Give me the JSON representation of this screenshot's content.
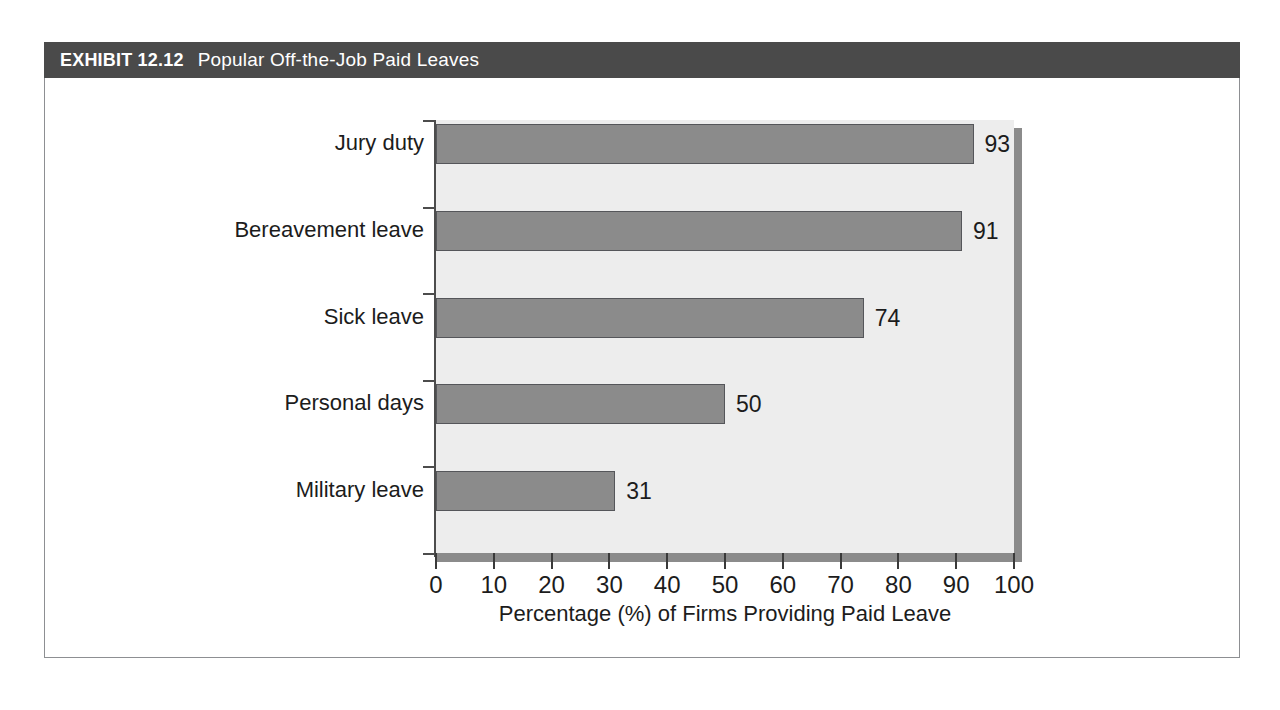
{
  "exhibit": {
    "number_label": "EXHIBIT 12.12",
    "title": "Popular Off-the-Job Paid Leaves",
    "header_bg": "#4a4a4a",
    "header_text_color": "#ffffff",
    "frame_border_color": "#8d8f92"
  },
  "chart_data": {
    "type": "bar",
    "orientation": "horizontal",
    "title": "Popular Off-the-Job Paid Leaves",
    "subtitle": "",
    "categories": [
      "Jury duty",
      "Bereavement leave",
      "Sick leave",
      "Personal days",
      "Military leave"
    ],
    "values": [
      93,
      91,
      74,
      50,
      31
    ],
    "data_labels": [
      "93",
      "91",
      "74",
      "50",
      "31"
    ],
    "xlabel": "Percentage (%) of Firms Providing Paid Leave",
    "ylabel": "",
    "xlim": [
      0,
      100
    ],
    "xticks": [
      0,
      10,
      20,
      30,
      40,
      50,
      60,
      70,
      80,
      90,
      100
    ],
    "xtick_labels": [
      "0",
      "10",
      "20",
      "30",
      "40",
      "50",
      "60",
      "70",
      "80",
      "90",
      "100"
    ],
    "grid": false,
    "legend": null,
    "legend_position": "none",
    "colors": {
      "bar_fill": "#8b8b8b",
      "bar_border": "#55565a",
      "plot_background": "#ededed",
      "shadow": "#8b8b8b",
      "axis_line": "#4c4c4c",
      "text": "#1c1c1c"
    }
  }
}
